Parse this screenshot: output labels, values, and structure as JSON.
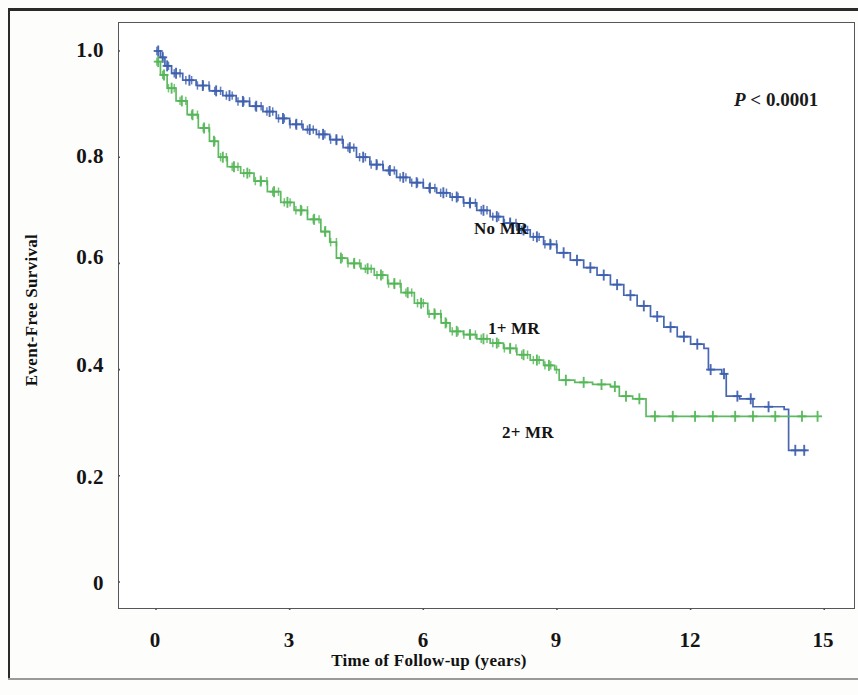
{
  "figure": {
    "kind": "kaplan-meier-survival-plot"
  },
  "annotations": {
    "pvalue_symbol": "P",
    "pvalue_rest": "< 0.0001",
    "pvalue_full": "P < 0.0001"
  },
  "labels": {
    "no_mr": "No MR",
    "one_plus_mr": "1+ MR",
    "two_plus_mr": "2+ MR"
  },
  "chart_data": {
    "type": "line",
    "title": "",
    "subtitle": "",
    "xlabel": "Time of Follow-up (years)",
    "ylabel": "Event-Free Survival",
    "xlim": [
      -0.6,
      15.7
    ],
    "ylim": [
      -0.06,
      1.07
    ],
    "xticks": [
      0,
      3,
      6,
      9,
      12,
      15
    ],
    "xticklabels": [
      "0",
      "3",
      "6",
      "9",
      "12",
      "15"
    ],
    "yticks": [
      0,
      0.2,
      0.4,
      0.6,
      0.8,
      1.0
    ],
    "yticklabels": [
      "0",
      "0.2",
      "0.4",
      "0.6",
      "0.8",
      "1.0"
    ],
    "grid": false,
    "legend_position": "inline-curve-labels",
    "annotations": [
      "P < 0.0001"
    ],
    "censor_marks": true,
    "colors": {
      "no_mr": "#3d5fae",
      "one_plus_mr": "#54b657",
      "axis": "#56565a",
      "text": "#141414",
      "background": "#ffffff"
    },
    "series": [
      {
        "name": "No MR",
        "color": "#3d5fae",
        "label_at": {
          "x": 4.5,
          "y": 0.7
        },
        "points": [
          [
            0.0,
            1.0
          ],
          [
            0.1,
            0.988
          ],
          [
            0.2,
            0.972
          ],
          [
            0.35,
            0.958
          ],
          [
            0.6,
            0.945
          ],
          [
            0.9,
            0.935
          ],
          [
            1.2,
            0.925
          ],
          [
            1.5,
            0.916
          ],
          [
            1.8,
            0.905
          ],
          [
            2.1,
            0.896
          ],
          [
            2.4,
            0.886
          ],
          [
            2.7,
            0.873
          ],
          [
            3.0,
            0.862
          ],
          [
            3.3,
            0.852
          ],
          [
            3.6,
            0.843
          ],
          [
            3.9,
            0.833
          ],
          [
            4.2,
            0.818
          ],
          [
            4.5,
            0.8
          ],
          [
            4.8,
            0.786
          ],
          [
            5.1,
            0.775
          ],
          [
            5.4,
            0.762
          ],
          [
            5.7,
            0.752
          ],
          [
            6.0,
            0.742
          ],
          [
            6.3,
            0.733
          ],
          [
            6.6,
            0.725
          ],
          [
            6.9,
            0.714
          ],
          [
            7.2,
            0.7
          ],
          [
            7.5,
            0.688
          ],
          [
            7.8,
            0.676
          ],
          [
            8.1,
            0.663
          ],
          [
            8.4,
            0.65
          ],
          [
            8.7,
            0.636
          ],
          [
            9.0,
            0.62
          ],
          [
            9.3,
            0.606
          ],
          [
            9.6,
            0.592
          ],
          [
            9.9,
            0.578
          ],
          [
            10.2,
            0.56
          ],
          [
            10.5,
            0.54
          ],
          [
            10.8,
            0.52
          ],
          [
            11.1,
            0.5
          ],
          [
            11.4,
            0.48
          ],
          [
            11.7,
            0.462
          ],
          [
            12.0,
            0.448
          ],
          [
            12.3,
            0.44
          ],
          [
            12.4,
            0.4
          ],
          [
            12.7,
            0.392
          ],
          [
            12.8,
            0.35
          ],
          [
            13.1,
            0.345
          ],
          [
            13.4,
            0.33
          ],
          [
            14.1,
            0.325
          ],
          [
            14.2,
            0.248
          ],
          [
            14.6,
            0.248
          ]
        ],
        "censor_x": [
          0.05,
          0.15,
          0.25,
          0.45,
          0.75,
          1.05,
          1.35,
          1.65,
          1.95,
          2.25,
          2.55,
          2.85,
          3.15,
          3.45,
          3.75,
          4.05,
          4.35,
          4.65,
          4.95,
          5.25,
          5.55,
          5.85,
          6.15,
          6.45,
          6.75,
          7.05,
          7.35,
          7.65,
          7.95,
          8.25,
          8.55,
          8.85,
          9.15,
          9.45,
          9.75,
          10.05,
          10.35,
          10.65,
          10.95,
          11.25,
          11.55,
          11.85,
          12.15,
          12.45,
          12.75,
          13.05,
          13.35,
          13.75,
          14.35,
          14.55
        ]
      },
      {
        "name": "1+ MR",
        "color": "#54b657",
        "label_at": {
          "x": 5.3,
          "y": 0.5
        },
        "points": [
          [
            0.0,
            0.98
          ],
          [
            0.1,
            0.955
          ],
          [
            0.25,
            0.93
          ],
          [
            0.45,
            0.906
          ],
          [
            0.7,
            0.88
          ],
          [
            0.95,
            0.855
          ],
          [
            1.2,
            0.83
          ],
          [
            1.4,
            0.8
          ],
          [
            1.6,
            0.782
          ],
          [
            1.9,
            0.77
          ],
          [
            2.2,
            0.755
          ],
          [
            2.5,
            0.735
          ],
          [
            2.8,
            0.715
          ],
          [
            3.1,
            0.7
          ],
          [
            3.4,
            0.683
          ],
          [
            3.7,
            0.66
          ],
          [
            3.9,
            0.64
          ],
          [
            4.05,
            0.61
          ],
          [
            4.3,
            0.6
          ],
          [
            4.6,
            0.59
          ],
          [
            4.9,
            0.578
          ],
          [
            5.2,
            0.562
          ],
          [
            5.5,
            0.545
          ],
          [
            5.8,
            0.525
          ],
          [
            6.1,
            0.505
          ],
          [
            6.4,
            0.488
          ],
          [
            6.6,
            0.472
          ],
          [
            6.9,
            0.466
          ],
          [
            7.2,
            0.458
          ],
          [
            7.5,
            0.45
          ],
          [
            7.8,
            0.44
          ],
          [
            8.1,
            0.428
          ],
          [
            8.4,
            0.418
          ],
          [
            8.7,
            0.408
          ],
          [
            8.95,
            0.4
          ],
          [
            9.05,
            0.38
          ],
          [
            9.4,
            0.376
          ],
          [
            9.8,
            0.372
          ],
          [
            10.2,
            0.368
          ],
          [
            10.4,
            0.35
          ],
          [
            10.7,
            0.345
          ],
          [
            11.0,
            0.312
          ],
          [
            11.4,
            0.312
          ],
          [
            12.0,
            0.312
          ],
          [
            12.8,
            0.312
          ],
          [
            13.6,
            0.312
          ],
          [
            14.3,
            0.312
          ],
          [
            14.75,
            0.312
          ]
        ],
        "censor_x": [
          0.05,
          0.18,
          0.35,
          0.58,
          0.82,
          1.08,
          1.3,
          1.5,
          1.75,
          2.05,
          2.35,
          2.65,
          2.95,
          3.25,
          3.55,
          3.8,
          4.15,
          4.45,
          4.75,
          5.05,
          5.35,
          5.65,
          5.95,
          6.25,
          6.5,
          6.75,
          7.05,
          7.35,
          7.65,
          7.95,
          8.25,
          8.55,
          8.82,
          9.2,
          9.6,
          10.0,
          10.3,
          10.55,
          10.85,
          11.2,
          11.6,
          12.1,
          12.5,
          13.0,
          13.4,
          13.9,
          14.5,
          14.85
        ]
      }
    ]
  }
}
